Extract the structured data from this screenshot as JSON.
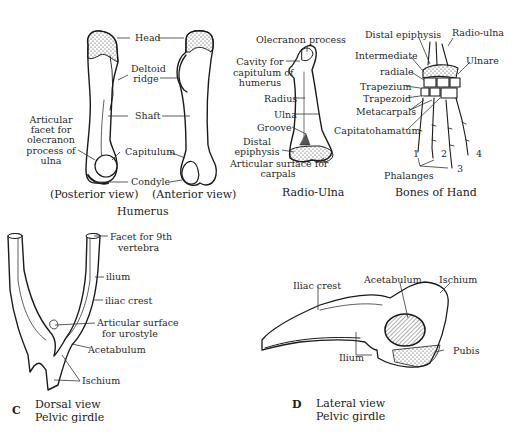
{
  "humerus": {
    "title": "Humerus",
    "posterior_caption": "(Posterior view)",
    "anterior_caption": "(Anterior view)",
    "labels": {
      "head": "Head",
      "deltoid_ridge_1": "Deltoid",
      "deltoid_ridge_2": "ridge",
      "shaft": "Shaft",
      "capitulum": "Capitulum",
      "condyle": "Condyle",
      "articular_1": "Articular",
      "articular_2": "facet for",
      "articular_3": "olecranon",
      "articular_4": "process of",
      "articular_5": "ulna"
    }
  },
  "radio_ulna": {
    "title": "Radio-Ulna",
    "labels": {
      "olecranon": "Olecranon process",
      "cavity_1": "Cavity for",
      "cavity_2": "capitulum of",
      "cavity_3": "humerus",
      "radius": "Radius",
      "ulna": "Ulna",
      "groove": "Groove",
      "distal_1": "Distal",
      "distal_2": "epiphysis",
      "articular_1": "Articular surface for",
      "articular_2": "carpals"
    }
  },
  "hand": {
    "title": "Bones of Hand",
    "labels": {
      "distal_epiphysis": "Distal epiphysis",
      "radio_ulna": "Radio-ulna",
      "intermediate": "Intermediate",
      "radiale": "radiale",
      "ulnare": "Ulnare",
      "trapezium": "Trapezium",
      "trapezoid": "Trapezoid",
      "metacarpals": "Metacarpals",
      "capitatohamatum": "Capitatohamatum",
      "phalanges": "Phalanges",
      "digit_1": "1",
      "digit_2": "2",
      "digit_3": "3",
      "digit_4": "4"
    }
  },
  "pelvic_dorsal": {
    "letter": "C",
    "caption_1": "Dorsal view",
    "caption_2": "Pelvic girdle",
    "labels": {
      "facet_1": "Facet for 9th",
      "facet_2": "vertebra",
      "ilium": "ilium",
      "iliac_crest": "iliac crest",
      "articular_1": "Articular surface",
      "articular_2": "for urostyle",
      "acetabulum": "Acetabulum",
      "ischium": "Ischium"
    }
  },
  "pelvic_lateral": {
    "letter": "D",
    "caption_1": "Lateral view",
    "caption_2": "Pelvic girdle",
    "labels": {
      "iliac_crest": "Iliac crest",
      "acetabulum": "Acetabulum",
      "ischium": "Ischium",
      "ilium": "Ilium",
      "pubis": "Pubis"
    }
  }
}
